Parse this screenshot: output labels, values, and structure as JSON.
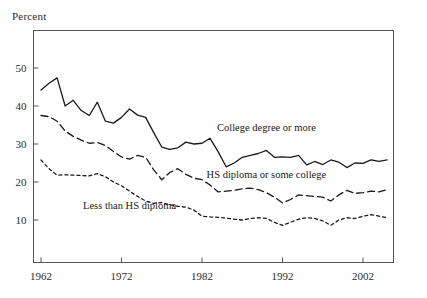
{
  "chart_data": {
    "type": "line",
    "title": "",
    "ylabel": "Percent",
    "xlabel": "",
    "xlim": [
      1962,
      2005
    ],
    "ylim": [
      0,
      55
    ],
    "grid": false,
    "legend_position": "inline-annotations",
    "yticks": [
      10,
      20,
      30,
      40,
      50
    ],
    "xticks": [
      1962,
      1972,
      1982,
      1992,
      2002
    ],
    "x": [
      1962,
      1963,
      1964,
      1965,
      1966,
      1967,
      1968,
      1969,
      1970,
      1971,
      1972,
      1973,
      1974,
      1975,
      1976,
      1977,
      1978,
      1979,
      1980,
      1981,
      1982,
      1983,
      1984,
      1985,
      1986,
      1987,
      1988,
      1989,
      1990,
      1991,
      1992,
      1993,
      1994,
      1995,
      1996,
      1997,
      1998,
      1999,
      2000,
      2001,
      2002,
      2003,
      2004,
      2005
    ],
    "series": [
      {
        "name": "College degree or more",
        "style": "solid",
        "values": [
          44.2,
          46.0,
          47.4,
          40.0,
          41.5,
          38.8,
          37.5,
          41.0,
          36.0,
          35.5,
          37.0,
          39.2,
          37.6,
          37.0,
          33.0,
          29.2,
          28.6,
          29.0,
          30.5,
          30.0,
          30.2,
          31.5,
          28.0,
          24.0,
          25.0,
          26.5,
          27.0,
          27.5,
          28.3,
          26.5,
          26.6,
          26.5,
          27.0,
          24.5,
          25.4,
          24.6,
          25.8,
          25.2,
          23.8,
          25.0,
          24.9,
          25.8,
          25.4,
          25.8
        ]
      },
      {
        "name": "HS diploma or some college",
        "style": "dashed",
        "values": [
          37.5,
          37.2,
          36.0,
          33.4,
          32.0,
          31.0,
          30.2,
          30.4,
          29.6,
          28.0,
          26.6,
          26.0,
          27.0,
          26.5,
          23.2,
          20.6,
          22.5,
          23.5,
          22.0,
          21.0,
          20.6,
          19.2,
          17.4,
          17.6,
          17.8,
          18.2,
          18.4,
          18.0,
          17.2,
          16.0,
          14.5,
          15.4,
          16.6,
          16.4,
          16.2,
          16.0,
          15.0,
          16.6,
          17.8,
          17.0,
          17.2,
          17.6,
          17.4,
          18.0
        ]
      },
      {
        "name": "Less than HS diploma",
        "style": "dotted",
        "values": [
          25.8,
          23.5,
          21.8,
          21.9,
          21.8,
          21.7,
          21.6,
          22.2,
          21.4,
          20.0,
          19.0,
          17.6,
          16.2,
          15.0,
          14.4,
          14.6,
          14.0,
          13.6,
          13.4,
          12.6,
          11.0,
          10.8,
          10.7,
          10.5,
          10.2,
          10.0,
          10.4,
          10.6,
          10.4,
          9.4,
          8.6,
          9.4,
          10.2,
          10.6,
          10.4,
          9.8,
          8.6,
          10.0,
          10.6,
          10.4,
          11.0,
          11.4,
          11.0,
          10.6
        ]
      }
    ],
    "annotations": [
      {
        "text": "College degree or more",
        "x": 1990,
        "y": 33.5
      },
      {
        "text": "HS diploma or some college",
        "x": 1990,
        "y": 21.0
      },
      {
        "text": "Less than HS diploma",
        "x": 1973,
        "y": 13.0
      }
    ],
    "colors": {
      "line": "#1a1a1a",
      "axis": "#555555",
      "text": "#2b2b2b",
      "background": "#ffffff"
    }
  }
}
